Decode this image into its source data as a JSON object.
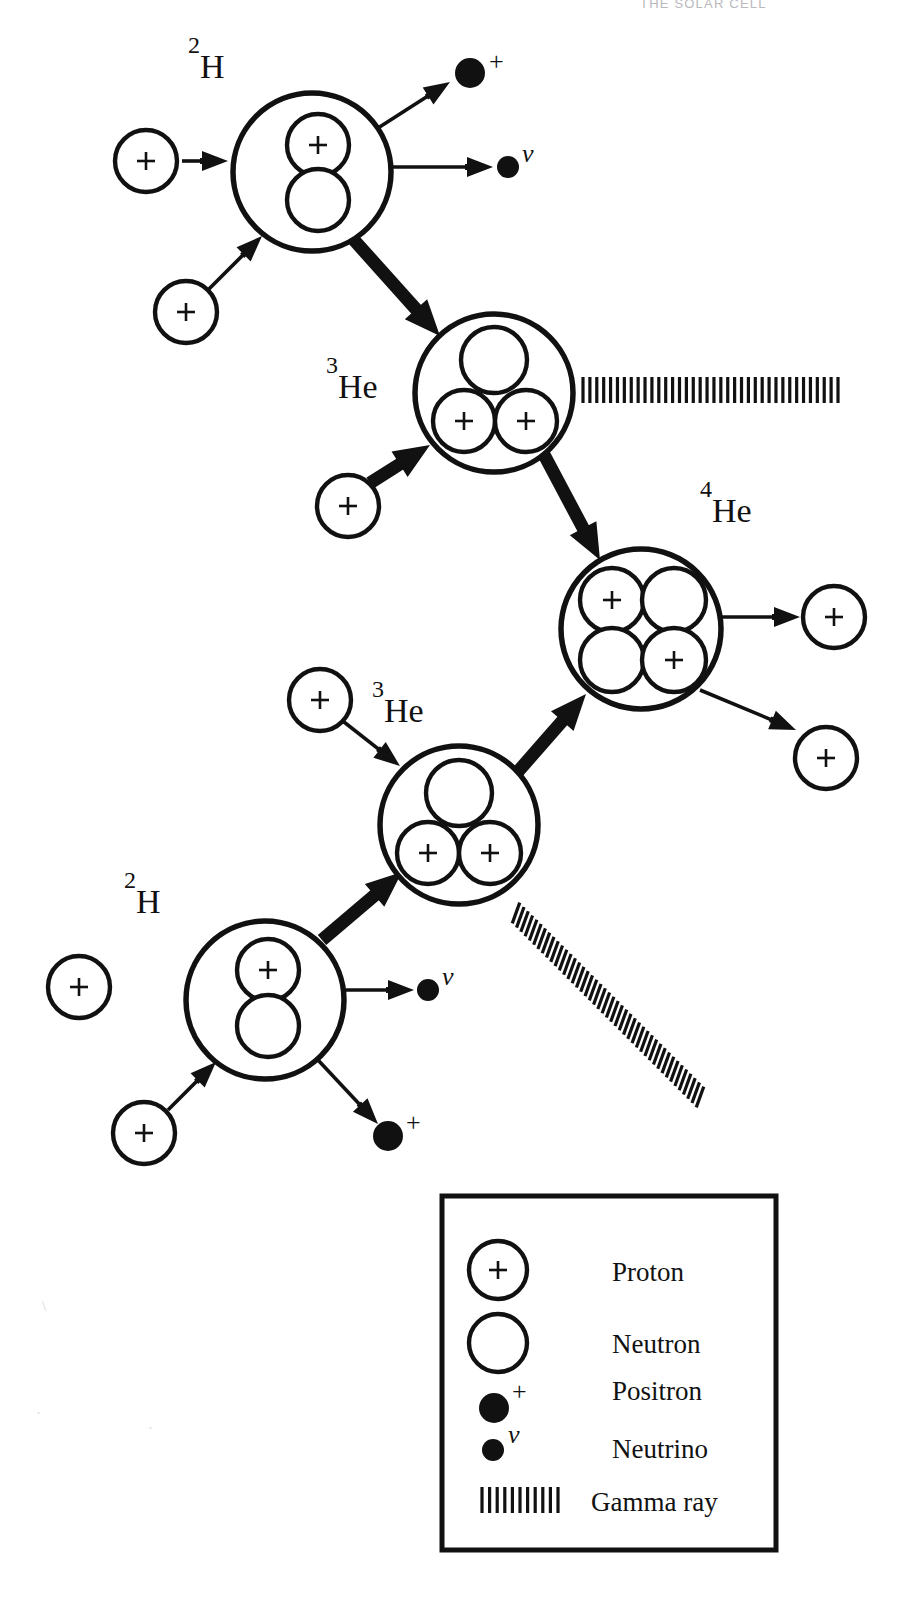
{
  "page": {
    "header_text": "THE SOLAR CELL",
    "background": "#ffffff",
    "ink": "#111111",
    "width": 916,
    "height": 1604
  },
  "diagram": {
    "nuclei": [
      {
        "id": "deuterium-top",
        "label_sup": "2",
        "label_base": "H",
        "label_x": 188,
        "label_y": 78,
        "cx": 312,
        "cy": 172,
        "r": 79,
        "nucleons": [
          {
            "type": "proton",
            "cx": 318,
            "cy": 145,
            "r": 31
          },
          {
            "type": "neutron",
            "cx": 318,
            "cy": 200,
            "r": 31
          }
        ]
      },
      {
        "id": "helium3-upper",
        "label_sup": "3",
        "label_base": "He",
        "label_x": 326,
        "label_y": 398,
        "cx": 494,
        "cy": 393,
        "r": 79,
        "nucleons": [
          {
            "type": "neutron",
            "cx": 494,
            "cy": 360,
            "r": 33
          },
          {
            "type": "proton",
            "cx": 464,
            "cy": 421,
            "r": 31
          },
          {
            "type": "proton",
            "cx": 526,
            "cy": 421,
            "r": 31
          }
        ]
      },
      {
        "id": "helium4",
        "label_sup": "4",
        "label_base": "He",
        "label_x": 700,
        "label_y": 522,
        "cx": 641,
        "cy": 629,
        "r": 80,
        "nucleons": [
          {
            "type": "proton",
            "cx": 612,
            "cy": 600,
            "r": 32
          },
          {
            "type": "neutron",
            "cx": 674,
            "cy": 600,
            "r": 32
          },
          {
            "type": "neutron",
            "cx": 612,
            "cy": 660,
            "r": 32
          },
          {
            "type": "proton",
            "cx": 674,
            "cy": 660,
            "r": 32
          }
        ]
      },
      {
        "id": "helium3-lower",
        "label_sup": "3",
        "label_base": "He",
        "label_x": 372,
        "label_y": 722,
        "cx": 459,
        "cy": 825,
        "r": 79,
        "nucleons": [
          {
            "type": "neutron",
            "cx": 459,
            "cy": 793,
            "r": 33
          },
          {
            "type": "proton",
            "cx": 428,
            "cy": 853,
            "r": 31
          },
          {
            "type": "proton",
            "cx": 490,
            "cy": 853,
            "r": 31
          }
        ]
      },
      {
        "id": "deuterium-bottom",
        "label_sup": "2",
        "label_base": "H",
        "label_x": 124,
        "label_y": 913,
        "cx": 265,
        "cy": 1000,
        "r": 79,
        "nucleons": [
          {
            "type": "proton",
            "cx": 268,
            "cy": 970,
            "r": 31
          },
          {
            "type": "neutron",
            "cx": 268,
            "cy": 1026,
            "r": 31
          }
        ]
      }
    ],
    "free_protons": [
      {
        "id": "proton-in-top-1",
        "cx": 146,
        "cy": 161,
        "r": 31
      },
      {
        "id": "proton-in-top-2",
        "cx": 186,
        "cy": 312,
        "r": 31
      },
      {
        "id": "proton-in-he3-upper",
        "cx": 348,
        "cy": 506,
        "r": 31
      },
      {
        "id": "proton-out-he4-right",
        "cx": 834,
        "cy": 617,
        "r": 31
      },
      {
        "id": "proton-out-he4-lower",
        "cx": 826,
        "cy": 758,
        "r": 31
      },
      {
        "id": "proton-in-he3-lower",
        "cx": 320,
        "cy": 700,
        "r": 31
      },
      {
        "id": "proton-in-bottom-1",
        "cx": 79,
        "cy": 987,
        "r": 31
      },
      {
        "id": "proton-in-bottom-2",
        "cx": 144,
        "cy": 1133,
        "r": 31
      }
    ],
    "positrons": [
      {
        "id": "positron-top",
        "cx": 470,
        "cy": 73,
        "r": 15,
        "sym": "+",
        "sym_x": 489,
        "sym_y": 70
      },
      {
        "id": "positron-bottom",
        "cx": 388,
        "cy": 1136,
        "r": 15,
        "sym": "+",
        "sym_x": 406,
        "sym_y": 1131
      }
    ],
    "neutrinos": [
      {
        "id": "neutrino-top",
        "cx": 508,
        "cy": 167,
        "r": 11,
        "sym": "ν",
        "sym_x": 522,
        "sym_y": 162
      },
      {
        "id": "neutrino-bottom",
        "cx": 428,
        "cy": 990,
        "r": 11,
        "sym": "ν",
        "sym_x": 442,
        "sym_y": 985
      }
    ],
    "gamma_rays": [
      {
        "id": "gamma-upper",
        "x1": 583,
        "y1": 390,
        "x2": 838,
        "y2": 390,
        "ticks": 38,
        "tick_len": 26,
        "angle_deg": 0
      },
      {
        "id": "gamma-lower",
        "x1": 516,
        "y1": 913,
        "x2": 700,
        "y2": 1097,
        "ticks": 44,
        "tick_len": 22,
        "angle_deg": 45
      }
    ],
    "arrows": [
      {
        "id": "arrow-p1-to-2H-top",
        "x1": 182,
        "y1": 161,
        "x2": 228,
        "y2": 161,
        "weight": "thin"
      },
      {
        "id": "arrow-p2-to-2H-top",
        "x1": 209,
        "y1": 289,
        "x2": 262,
        "y2": 236,
        "weight": "thin"
      },
      {
        "id": "arrow-2H-top-to-positron",
        "x1": 378,
        "y1": 128,
        "x2": 450,
        "y2": 82,
        "weight": "thin"
      },
      {
        "id": "arrow-2H-top-to-neutrino",
        "x1": 392,
        "y1": 167,
        "x2": 493,
        "y2": 167,
        "weight": "thin"
      },
      {
        "id": "arrow-2H-top-to-3He",
        "x1": 354,
        "y1": 240,
        "x2": 440,
        "y2": 336,
        "weight": "thick"
      },
      {
        "id": "arrow-p-to-3He-upper",
        "x1": 370,
        "y1": 483,
        "x2": 430,
        "y2": 445,
        "weight": "thick"
      },
      {
        "id": "arrow-3He-upper-to-4He",
        "x1": 540,
        "y1": 447,
        "x2": 600,
        "y2": 560,
        "weight": "thick"
      },
      {
        "id": "arrow-4He-to-proton-right",
        "x1": 722,
        "y1": 617,
        "x2": 800,
        "y2": 617,
        "weight": "thin"
      },
      {
        "id": "arrow-4He-to-proton-lower",
        "x1": 700,
        "y1": 690,
        "x2": 796,
        "y2": 730,
        "weight": "thin"
      },
      {
        "id": "arrow-3He-lower-to-4He",
        "x1": 515,
        "y1": 775,
        "x2": 586,
        "y2": 694,
        "weight": "thick"
      },
      {
        "id": "arrow-p-to-3He-lower",
        "x1": 344,
        "y1": 722,
        "x2": 400,
        "y2": 766,
        "weight": "thin"
      },
      {
        "id": "arrow-2H-bottom-to-3He",
        "x1": 322,
        "y1": 940,
        "x2": 402,
        "y2": 872,
        "weight": "thick"
      },
      {
        "id": "arrow-2H-bottom-to-neutrino",
        "x1": 345,
        "y1": 990,
        "x2": 414,
        "y2": 990,
        "weight": "thin"
      },
      {
        "id": "arrow-2H-bottom-to-positron",
        "x1": 318,
        "y1": 1060,
        "x2": 378,
        "y2": 1124,
        "weight": "thin"
      },
      {
        "id": "arrow-p-to-2H-bottom",
        "x1": 168,
        "y1": 1110,
        "x2": 216,
        "y2": 1062,
        "weight": "thin"
      }
    ]
  },
  "legend": {
    "box": {
      "x": 442,
      "y": 1196,
      "width": 334,
      "height": 354
    },
    "items": [
      {
        "id": "legend-proton",
        "glyph": "proton",
        "label": "Proton",
        "icon_cx": 498,
        "icon_cy": 1270,
        "icon_r": 29,
        "label_x": 612,
        "label_y": 1281
      },
      {
        "id": "legend-neutron",
        "glyph": "neutron",
        "label": "Neutron",
        "icon_cx": 498,
        "icon_cy": 1343,
        "icon_r": 29,
        "label_x": 612,
        "label_y": 1353
      },
      {
        "id": "legend-positron",
        "glyph": "positron",
        "label": "Positron",
        "icon_cx": 494,
        "icon_cy": 1408,
        "icon_r": 15,
        "sym": "+",
        "sym_x": 512,
        "sym_y": 1400,
        "label_x": 612,
        "label_y": 1400
      },
      {
        "id": "legend-neutrino",
        "glyph": "neutrino",
        "label": "Neutrino",
        "icon_cx": 493,
        "icon_cy": 1450,
        "icon_r": 11,
        "sym": "ν",
        "sym_x": 508,
        "sym_y": 1443,
        "label_x": 612,
        "label_y": 1458
      },
      {
        "id": "legend-gamma",
        "glyph": "gamma",
        "label": "Gamma ray",
        "gamma_x1": 482,
        "gamma_y1": 1500,
        "gamma_x2": 558,
        "gamma_y2": 1500,
        "gamma_ticks": 11,
        "gamma_tick_len": 26,
        "label_x": 591,
        "label_y": 1511
      }
    ]
  },
  "chart_data": {
    "type": "diagram",
    "branches": [
      {
        "name": "upper-branch",
        "steps": [
          "proton + proton -> 2H (deuterium) + positron + neutrino",
          "2H + proton -> 3He + gamma ray",
          "3He + 3He -> 4He + proton + proton"
        ]
      },
      {
        "name": "lower-branch",
        "steps": [
          "proton + proton -> 2H (deuterium) + positron + neutrino",
          "2H + proton -> 3He + gamma ray"
        ]
      }
    ],
    "particle_key": [
      "Proton",
      "Neutron",
      "Positron",
      "Neutrino",
      "Gamma ray"
    ]
  }
}
